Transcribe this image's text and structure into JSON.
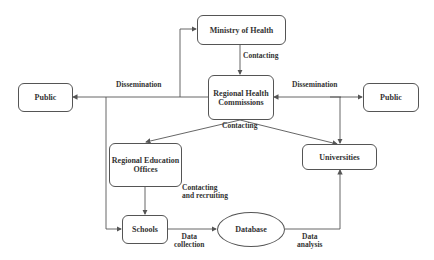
{
  "diagram": {
    "nodes": {
      "ministry": "Ministry of Health",
      "rhc": "Regional Health Commissions",
      "public_left": "Public",
      "public_right": "Public",
      "reo": "Regional Education Offices",
      "universities": "Universities",
      "schools": "Schools",
      "database": "Database"
    },
    "edges": {
      "ministry_to_rhc": "Contacting",
      "dissemination_left": "Dissemination",
      "dissemination_right": "Dissemination",
      "rhc_contacting": "Contacting",
      "reo_to_schools_1": "Contacting",
      "reo_to_schools_2": "and recruiting",
      "data_collection_1": "Data",
      "data_collection_2": "collection",
      "data_analysis_1": "Data",
      "data_analysis_2": "analysis"
    },
    "colors": {
      "line": "#555555",
      "text": "#333333"
    }
  }
}
